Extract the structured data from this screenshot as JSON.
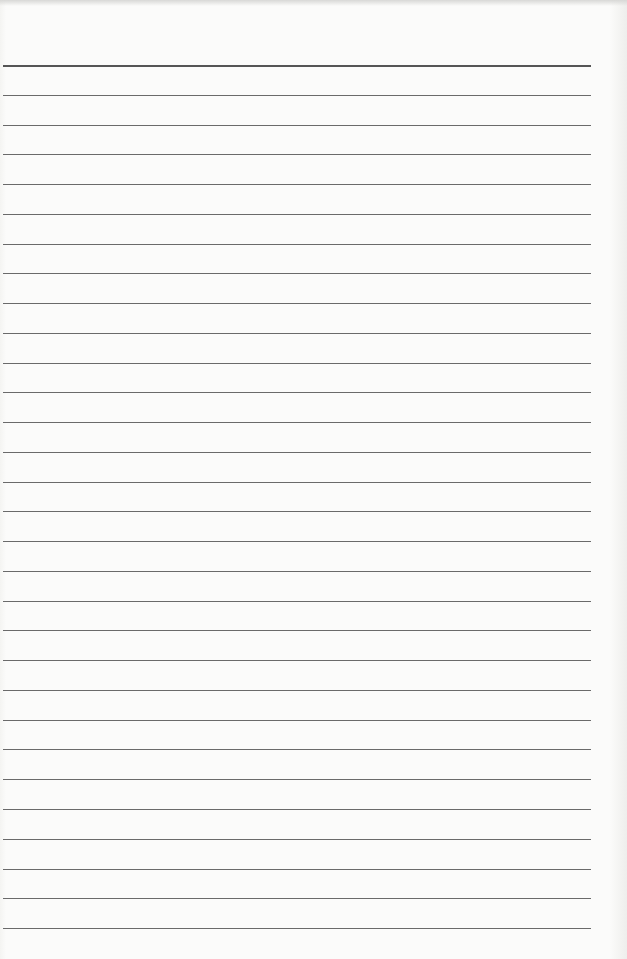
{
  "page": {
    "type": "lined-paper",
    "background": "#fbfbfa",
    "rule_color": "#6a6a6a",
    "rule_count": 30,
    "first_rule_y": 65,
    "rule_spacing": 29.76,
    "rule_left": 3,
    "rule_width": 588,
    "text": ""
  }
}
